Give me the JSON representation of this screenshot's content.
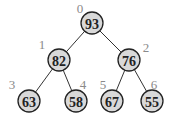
{
  "diagram": {
    "type": "binary-heap-tree",
    "colors": {
      "node_fill": "#d9d9d9",
      "node_stroke": "#222222",
      "edge": "#333333",
      "index_label": "#8a8a8a"
    },
    "nodes": [
      {
        "index": "0",
        "value": "93",
        "cx": 92,
        "cy": 23,
        "lx": 80,
        "ly": 8
      },
      {
        "index": "1",
        "value": "82",
        "cx": 59,
        "cy": 60,
        "lx": 42,
        "ly": 44
      },
      {
        "index": "2",
        "value": "76",
        "cx": 129,
        "cy": 60,
        "lx": 146,
        "ly": 47
      },
      {
        "index": "3",
        "value": "63",
        "cx": 29,
        "cy": 101,
        "lx": 12,
        "ly": 84
      },
      {
        "index": "4",
        "value": "58",
        "cx": 76,
        "cy": 101,
        "lx": 83,
        "ly": 84
      },
      {
        "index": "5",
        "value": "67",
        "cx": 112,
        "cy": 101,
        "lx": 103,
        "ly": 84
      },
      {
        "index": "6",
        "value": "55",
        "cx": 152,
        "cy": 101,
        "lx": 154,
        "ly": 84
      }
    ],
    "edges": [
      {
        "from": 0,
        "to": 1
      },
      {
        "from": 0,
        "to": 2
      },
      {
        "from": 1,
        "to": 3
      },
      {
        "from": 1,
        "to": 4
      },
      {
        "from": 2,
        "to": 5
      },
      {
        "from": 2,
        "to": 6
      }
    ]
  }
}
